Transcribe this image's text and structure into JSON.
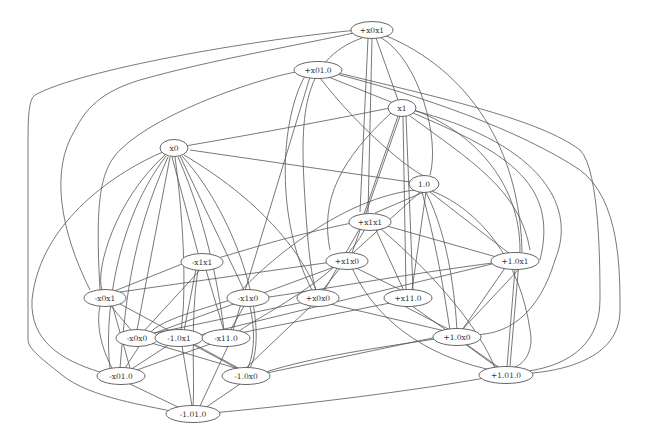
{
  "diagram": {
    "type": "undirected-graph",
    "nodes": [
      {
        "id": "n_ex0x1",
        "label": "+x0x1",
        "x": 372,
        "y": 30
      },
      {
        "id": "n_ex010",
        "label": "+x01.0",
        "x": 318,
        "y": 70
      },
      {
        "id": "n_x1",
        "label": "x1",
        "x": 402,
        "y": 108
      },
      {
        "id": "n_x0",
        "label": "x0",
        "x": 174,
        "y": 148
      },
      {
        "id": "n_10",
        "label": "1.0",
        "x": 424,
        "y": 184
      },
      {
        "id": "n_ex1x1",
        "label": "+x1x1",
        "x": 370,
        "y": 222
      },
      {
        "id": "n_mx1x1",
        "label": "-x1x1",
        "x": 202,
        "y": 262
      },
      {
        "id": "n_ex1x0",
        "label": "+x1x0",
        "x": 347,
        "y": 261
      },
      {
        "id": "n_e10x1",
        "label": "+1.0x1",
        "x": 515,
        "y": 261
      },
      {
        "id": "n_mx0x1",
        "label": "-x0x1",
        "x": 105,
        "y": 298
      },
      {
        "id": "n_mx1x0",
        "label": "-x1x0",
        "x": 248,
        "y": 298
      },
      {
        "id": "n_ex0x0",
        "label": "+x0x0",
        "x": 318,
        "y": 298
      },
      {
        "id": "n_ex110",
        "label": "+x11.0",
        "x": 408,
        "y": 298
      },
      {
        "id": "n_mx0x0",
        "label": "-x0x0",
        "x": 137,
        "y": 338
      },
      {
        "id": "n_m10x1",
        "label": "-1.0x1",
        "x": 179,
        "y": 338
      },
      {
        "id": "n_mx110",
        "label": "-x11.0",
        "x": 226,
        "y": 338
      },
      {
        "id": "n_e10x0",
        "label": "+1.0x0",
        "x": 457,
        "y": 337
      },
      {
        "id": "n_mx010",
        "label": "-x01.0",
        "x": 121,
        "y": 376
      },
      {
        "id": "n_m10x0",
        "label": "-1.0x0",
        "x": 246,
        "y": 376
      },
      {
        "id": "n_e1010",
        "label": "+1.01.0",
        "x": 506,
        "y": 375
      },
      {
        "id": "n_m1010",
        "label": "-1.01.0",
        "x": 193,
        "y": 414
      }
    ],
    "edges": [
      "M358,30 C250,40 80,70 35,95 C28,100 28,120 28,150",
      "M28,150 L28,340 C28,350 50,365 62,375 C90,398 150,406 175,412",
      "M358,32 C300,45 210,60 140,80 C100,92 85,110 75,130",
      "M75,130 C50,170 60,230 90,290",
      "M362,38 C300,60 300,120 305,200 C308,250 312,280 316,290",
      "M368,38 L360,212",
      "M372,38 L368,213",
      "M376,38 L398,100",
      "M380,37 C420,60 440,140 430,175",
      "M384,35 C470,70 520,150 522,252",
      "M302,71 C270,75 160,110 120,150 C100,170 95,200 100,290",
      "M305,76 C280,120 275,220 312,290",
      "M310,77 L233,330",
      "M320,78 C360,130 410,170 424,176",
      "M326,76 L396,104",
      "M332,73 C420,95 520,130 580,170 C620,200 620,270 620,310 C620,360 560,372 520,374",
      "M334,72 C450,100 540,120 580,150 C600,170 600,270 600,300 C600,350 560,368 521,372",
      "M390,108 C330,120 250,135 185,146",
      "M398,116 L364,214",
      "M400,116 L352,253",
      "M403,116 L406,290",
      "M406,116 L413,290",
      "M410,116 C470,160 520,190 530,250",
      "M413,113 C500,150 560,180 540,260",
      "M412,110 C530,140 580,200 555,260 C540,310 510,340 462,334",
      "M414,110 C470,130 520,180 520,250 L510,366",
      "M392,112 C340,160 320,200 330,250",
      "M190,150 L410,182",
      "M163,152 C120,170 40,220 32,300 C30,340 60,360 100,372",
      "M165,155 C115,200 95,270 102,290",
      "M166,156 C110,230 105,330 110,368",
      "M168,157 C130,240 125,310 120,368",
      "M170,157 L137,330",
      "M172,157 L198,253",
      "M175,157 C185,230 186,300 181,330",
      "M178,157 C210,230 220,300 224,330",
      "M180,156 L244,290",
      "M182,156 C240,220 270,330 250,368",
      "M184,155 C260,200 300,250 316,290",
      "M424,192 L375,213",
      "M420,192 L353,253",
      "M426,192 L412,290",
      "M430,192 L510,254",
      "M432,191 C480,210 520,260 530,330 C535,355 520,368 510,368",
      "M426,192 C450,240 455,300 457,330",
      "M422,192 C440,260 445,300 450,330",
      "M415,190 C330,200 250,280 240,292",
      "M357,222 C290,235 230,255 218,258",
      "M360,228 L324,291",
      "M376,230 L404,291",
      "M380,224 L500,258",
      "M365,229 C340,280 250,320 237,333",
      "M380,228 C440,280 480,330 495,368",
      "M187,262 L112,292",
      "M196,269 L184,331",
      "M200,270 L144,331",
      "M206,270 L224,331",
      "M198,270 C190,320 195,380 193,406",
      "M332,262 L120,292",
      "M337,266 L152,334",
      "M356,268 L403,291",
      "M352,268 C380,330 440,360 496,371",
      "M340,268 L322,291",
      "M500,262 L196,336",
      "M505,268 L462,330",
      "M515,269 L507,367",
      "M520,268 L460,332",
      "M233,299 C200,310 160,320 150,333",
      "M244,306 L230,331",
      "M250,306 C255,330 255,350 248,368",
      "M262,298 C320,290 400,275 500,262",
      "M304,302 L150,334",
      "M330,304 L445,331",
      "M312,305 L246,368",
      "M395,302 L240,333",
      "M404,306 L450,330",
      "M412,306 L500,368",
      "M112,304 L130,368",
      "M110,305 L132,331",
      "M120,304 L242,370",
      "M100,306 C95,330 105,355 112,368",
      "M140,345 L125,368",
      "M148,342 L242,370",
      "M182,346 L192,406",
      "M170,344 L130,370",
      "M188,342 L240,370",
      "M228,346 L200,406",
      "M216,342 L134,371",
      "M442,336 L262,374",
      "M465,344 L498,368",
      "M130,384 L180,408",
      "M240,384 L205,408",
      "M212,413 C300,405 420,390 490,377",
      "M442,338 C360,350 300,360 260,374"
    ]
  }
}
